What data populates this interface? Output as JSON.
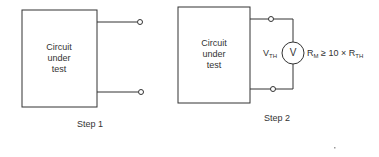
{
  "step1": {
    "box_label_lines": [
      "Circuit",
      "under",
      "test"
    ],
    "caption": "Step 1"
  },
  "step2": {
    "box_label_lines": [
      "Circuit",
      "under",
      "test"
    ],
    "caption": "Step 2",
    "meter_symbol": "V",
    "vth_main": "V",
    "vth_sub": "TH",
    "rm_main": "R",
    "rm_sub": "M",
    "relation": "≥ 10 × R",
    "rth_sub": "TH"
  }
}
